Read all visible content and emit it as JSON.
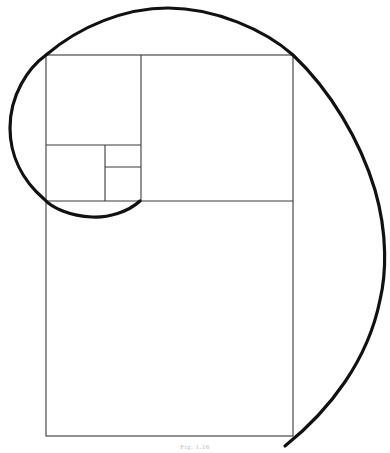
{
  "figure": {
    "caption": "Fig. 1.16",
    "colors": {
      "lines": "#3a3a3a",
      "spiral": "#111111",
      "background": "#ffffff"
    }
  }
}
